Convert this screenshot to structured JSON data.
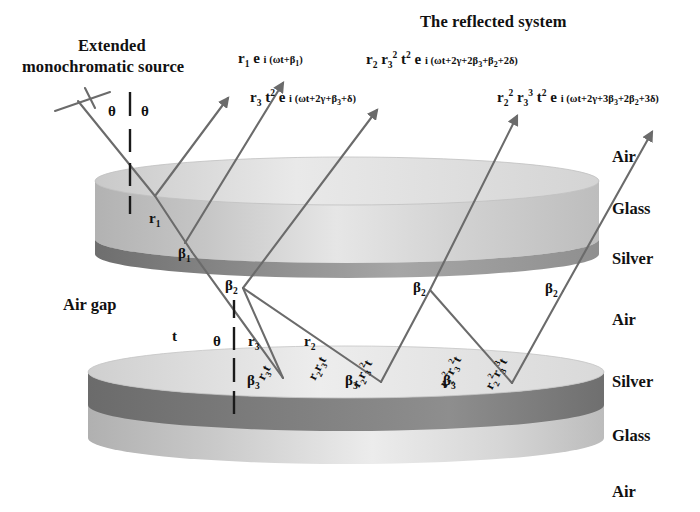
{
  "diagram": {
    "title": "The reflected system",
    "source_label_line1": "Extended",
    "source_label_line2": "monochromatic source",
    "air_gap_label": "Air gap",
    "incidence_angle": "θ",
    "reflection_angle": "θ",
    "gap_angle": "θ",
    "gap_thickness": "t",
    "colors": {
      "glass": "#b9b9b9",
      "glass_light": "#d8d8d8",
      "silver": "#7b7b7b",
      "silver_dark": "#6a6a6a",
      "ray": "#6b6b6b",
      "text": "#111111",
      "background": "#ffffff"
    }
  },
  "material_labels": [
    {
      "name": "Air",
      "text": "Air"
    },
    {
      "name": "Glass",
      "text": "Glass"
    },
    {
      "name": "Silver",
      "text": "Silver"
    },
    {
      "name": "Air2",
      "text": "Air"
    },
    {
      "name": "Silver2",
      "text": "Silver"
    },
    {
      "name": "Glass2",
      "text": "Glass"
    },
    {
      "name": "Air3",
      "text": "Air"
    }
  ],
  "formulas": [
    {
      "id": "beam-1",
      "prefix": "r",
      "plain": "r₁ e i (ωt+β₁)",
      "html": "r<sub>1</sub> e <span class=\"iarg\">i (ωt+β<sub>1</sub>)</span>"
    },
    {
      "id": "beam-2",
      "plain": "r₃ t² e i (ωt+2γ+β₃+δ)",
      "html": "r<sub>3</sub> t<sup>2</sup> e <span class=\"iarg\">i (ωt+2γ+β<sub>3</sub>+δ)</span>"
    },
    {
      "id": "beam-3",
      "plain": "r₂ r₃² t² e i (ωt+2γ+2β₃+β₂+2δ)",
      "html": "r<sub>2</sub> r<sub>3</sub><sup>2</sup> t<sup>2</sup> e <span class=\"iarg\">i (ωt+2γ+2β<sub>3</sub>+β<sub>2</sub>+2δ)</span>"
    },
    {
      "id": "beam-4",
      "plain": "r₂² r₃³ t² e i (ωt+2γ+3β₃+2β₂+3δ)",
      "html": "r<sub>2</sub><sup>2</sup> r<sub>3</sub><sup>3</sup> t<sup>2</sup> e <span class=\"iarg\">i (ωt+2γ+3β<sub>3</sub>+2β<sub>2</sub>+3δ)</span>"
    }
  ],
  "phase_labels": [
    {
      "id": "beta1",
      "plain": "β₁",
      "html": "β<sub>1</sub>"
    },
    {
      "id": "beta2-a",
      "plain": "β₂",
      "html": "β<sub>2</sub>"
    },
    {
      "id": "beta2-b",
      "plain": "β₂",
      "html": "β<sub>2</sub>"
    },
    {
      "id": "beta2-c",
      "plain": "β₂",
      "html": "β<sub>2</sub>"
    },
    {
      "id": "beta3-a",
      "plain": "β₃",
      "html": "β<sub>3</sub>"
    },
    {
      "id": "beta3-b",
      "plain": "β₃",
      "html": "β<sub>3</sub>"
    },
    {
      "id": "beta3-c",
      "plain": "β₃",
      "html": "β<sub>3</sub>"
    }
  ],
  "amplitude_labels": [
    {
      "id": "r1",
      "plain": "r₁",
      "html": "r<sub>1</sub>"
    },
    {
      "id": "r3",
      "plain": "r₃",
      "html": "r<sub>3</sub>"
    },
    {
      "id": "r2",
      "plain": "r₂",
      "html": "r<sub>2</sub>"
    }
  ],
  "ray_labels_rotated": [
    {
      "id": "ray-r3t",
      "plain": "r₃t",
      "html": "r<sub>3</sub>t"
    },
    {
      "id": "ray-r2r3t",
      "plain": "r₂r₃t",
      "html": "r<sub>2</sub>r<sub>3</sub>t"
    },
    {
      "id": "ray-r2r3-2t",
      "plain": "r₂r₃²t",
      "html": "r<sub>2</sub>r<sub>3</sub><sup>2</sup>t"
    },
    {
      "id": "ray-r2-2r3-2t",
      "plain": "r₂²r₃²t",
      "html": "r<sub>2</sub><sup>2</sup>r<sub>3</sub><sup>2</sup>t"
    },
    {
      "id": "ray-r2-2r3-3t",
      "plain": "r₂²r₃³t",
      "html": "r<sub>2</sub><sup>2</sup>r<sub>3</sub><sup>3</sup>t"
    }
  ],
  "chart_data": {
    "type": "diagram",
    "title": "The reflected system",
    "layers_top_plate": [
      "Air",
      "Glass",
      "Silver"
    ],
    "layers_gap": [
      "Air"
    ],
    "layers_bottom_plate": [
      "Silver",
      "Glass",
      "Air"
    ]
  }
}
